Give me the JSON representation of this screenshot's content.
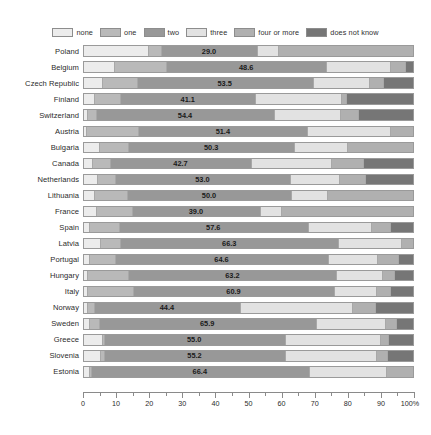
{
  "chart_data": {
    "type": "bar",
    "subtype": "stacked-horizontal-100pct",
    "title": "",
    "xlabel": "",
    "ylabel": "",
    "xlim": [
      0,
      100
    ],
    "xtick_labels": [
      "0",
      "10",
      "20",
      "30",
      "40",
      "50",
      "60",
      "70",
      "80",
      "90",
      "100%"
    ],
    "xticks": [
      0,
      10,
      20,
      30,
      40,
      50,
      60,
      70,
      80,
      90,
      100
    ],
    "xtick_minor_step": 5,
    "grid": false,
    "legend_position": "top-center",
    "legend": [
      "none",
      "one",
      "two",
      "three",
      "four or more",
      "does not know"
    ],
    "series": [
      {
        "name": "none",
        "color": "#ececec"
      },
      {
        "name": "one",
        "color": "#b9b9b9"
      },
      {
        "name": "two",
        "color": "#989898"
      },
      {
        "name": "three",
        "color": "#e2e2e2"
      },
      {
        "name": "four or more",
        "color": "#b0b0b0"
      },
      {
        "name": "does not know",
        "color": "#767676"
      }
    ],
    "categories": [
      "Poland",
      "Belgium",
      "Czech Republic",
      "Finland",
      "Switzerland",
      "Austria",
      "Bulgaria",
      "Canada",
      "Netherlands",
      "Lithuania",
      "France",
      "Spain",
      "Latvia",
      "Portugal",
      "Hungary",
      "Italy",
      "Norway",
      "Sweden",
      "Greece",
      "Slovenia",
      "Estonia"
    ],
    "labeled_series": "two",
    "rows": [
      {
        "country": "Poland",
        "label": "29.0",
        "values": [
          19.5,
          4.0,
          29.0,
          6.5,
          41.0,
          0.0
        ]
      },
      {
        "country": "Belgium",
        "label": "48.6",
        "values": [
          9.0,
          16.0,
          48.6,
          19.4,
          4.5,
          2.5
        ]
      },
      {
        "country": "Czech Republic",
        "label": "53.5",
        "values": [
          5.5,
          10.5,
          53.5,
          17.0,
          4.5,
          9.0
        ]
      },
      {
        "country": "Finland",
        "label": "41.1",
        "values": [
          3.0,
          8.0,
          41.1,
          26.0,
          1.5,
          20.4
        ]
      },
      {
        "country": "Switzerland",
        "label": "54.4",
        "values": [
          1.0,
          2.5,
          54.4,
          20.0,
          5.5,
          16.6
        ]
      },
      {
        "country": "Austria",
        "label": "51.4",
        "values": [
          0.5,
          16.0,
          51.4,
          25.0,
          7.1,
          0.0
        ]
      },
      {
        "country": "Bulgaria",
        "label": "50.3",
        "values": [
          4.5,
          9.0,
          50.3,
          16.0,
          20.2,
          0.0
        ]
      },
      {
        "country": "Canada",
        "label": "42.7",
        "values": [
          2.5,
          5.5,
          42.7,
          24.5,
          9.5,
          15.3
        ]
      },
      {
        "country": "Netherlands",
        "label": "53.0",
        "values": [
          4.0,
          5.5,
          53.0,
          15.0,
          8.0,
          14.5
        ]
      },
      {
        "country": "Lithuania",
        "label": "50.0",
        "values": [
          3.0,
          10.0,
          50.0,
          11.0,
          26.0,
          0.0
        ]
      },
      {
        "country": "France",
        "label": "39.0",
        "values": [
          3.5,
          11.0,
          39.0,
          6.5,
          40.0,
          0.0
        ]
      },
      {
        "country": "Spain",
        "label": "57.6",
        "values": [
          1.5,
          9.0,
          57.6,
          19.0,
          6.0,
          6.9
        ]
      },
      {
        "country": "Latvia",
        "label": "66.3",
        "values": [
          5.0,
          6.0,
          66.3,
          19.0,
          3.7,
          0.0
        ]
      },
      {
        "country": "Portugal",
        "label": "64.6",
        "values": [
          1.5,
          8.0,
          64.6,
          15.0,
          6.5,
          4.4
        ]
      },
      {
        "country": "Hungary",
        "label": "63.2",
        "values": [
          1.0,
          12.5,
          63.2,
          14.0,
          3.5,
          5.8
        ]
      },
      {
        "country": "Italy",
        "label": "60.9",
        "values": [
          1.0,
          14.0,
          60.9,
          13.0,
          4.0,
          7.1
        ]
      },
      {
        "country": "Norway",
        "label": "44.4",
        "values": [
          1.0,
          2.0,
          44.4,
          34.0,
          7.0,
          11.6
        ]
      },
      {
        "country": "Sweden",
        "label": "65.9",
        "values": [
          1.5,
          3.0,
          65.9,
          21.0,
          3.5,
          5.1
        ]
      },
      {
        "country": "Greece",
        "label": "55.0",
        "values": [
          5.5,
          0.5,
          55.0,
          29.0,
          2.5,
          7.5
        ]
      },
      {
        "country": "Slovenia",
        "label": "55.2",
        "values": [
          5.0,
          1.0,
          55.2,
          27.5,
          3.5,
          7.8
        ]
      },
      {
        "country": "Estonia",
        "label": "66.4",
        "values": [
          1.5,
          0.5,
          66.4,
          23.5,
          8.1,
          0.0
        ]
      }
    ]
  }
}
